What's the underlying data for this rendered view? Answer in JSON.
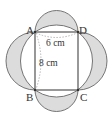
{
  "diagram": {
    "points": {
      "A": {
        "label": "A",
        "x": 35,
        "y": 32
      },
      "D": {
        "label": "D",
        "x": 78,
        "y": 32
      },
      "B": {
        "label": "B",
        "x": 35,
        "y": 90
      },
      "C": {
        "label": "C",
        "x": 78,
        "y": 90
      }
    },
    "dimensions": {
      "width_label": "6 cm",
      "height_label": "8 cm"
    },
    "colors": {
      "stroke": "#555555",
      "shade": "#dcdcdc",
      "rect_stroke": "#444444",
      "dash": "#888888"
    }
  }
}
